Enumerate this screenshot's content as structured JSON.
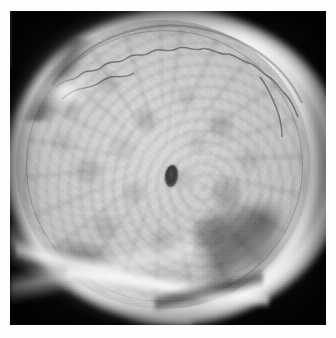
{
  "page": {
    "kind": "radiograph-image",
    "margin_color": "#fdfdfd"
  },
  "plate": {
    "background_color": "#0c0c0c",
    "halo_color": "#f4f4f4",
    "bone_mid_color": "#c9c9c9",
    "bone_light_color": "#d8d8d8",
    "shadow_color": "#3a3a3a",
    "width_px": 316,
    "height_px": 314,
    "offset_x_px": 10,
    "offset_y_px": 11
  },
  "anatomy": {
    "vault_label": "cranial-vault",
    "halo_label": "soft-tissue-halo",
    "suture_label": "coronal-suture",
    "center_label": "central-density",
    "center_x_px": 161,
    "center_y_px": 165,
    "center_w_px": 13,
    "center_h_px": 22,
    "spoke_label": "diploic-vascular-markings",
    "patch_label": "petromastoid-shadow",
    "base_label": "skull-base-overlap",
    "streak_label": "bright-edge-streak"
  }
}
